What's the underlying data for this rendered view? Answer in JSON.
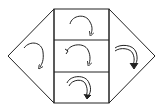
{
  "diagram": {
    "stroke_color": "#222222",
    "background": "#ffffff",
    "regions": [
      {
        "id": "left-triangle",
        "arrow": "single-clockwise"
      },
      {
        "id": "center-top",
        "arrow": "single-clockwise"
      },
      {
        "id": "center-middle",
        "arrow": "single-clockwise-with-tail"
      },
      {
        "id": "center-bottom",
        "arrow": "double-clockwise"
      },
      {
        "id": "right-triangle",
        "arrow": "double-clockwise"
      }
    ]
  }
}
